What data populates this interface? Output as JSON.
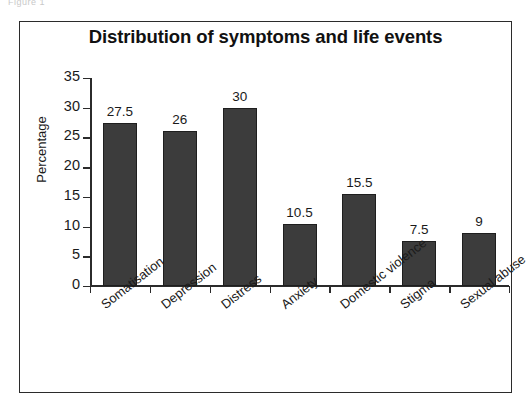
{
  "figure": {
    "caption": "Figure 1"
  },
  "chart_data": {
    "type": "bar",
    "title": "Distribution of symptoms and life events",
    "xlabel": "",
    "ylabel": "Percentage",
    "categories": [
      "Somatisation",
      "Depression",
      "Distress",
      "Anxiety",
      "Domestic violence",
      "Stigma",
      "Sexual abuse"
    ],
    "values": [
      27.5,
      26,
      30,
      10.5,
      15.5,
      7.5,
      9
    ],
    "value_labels": [
      "27.5",
      "26",
      "30",
      "10.5",
      "15.5",
      "7.5",
      "9"
    ],
    "ylim": [
      0,
      35
    ],
    "ytick_labels": [
      "0",
      "5",
      "10",
      "15",
      "20",
      "25",
      "30",
      "35"
    ],
    "ytick_values": [
      0,
      5,
      10,
      15,
      20,
      25,
      30,
      35
    ],
    "grid": false,
    "legend": false,
    "bar_color": "#3c3c3c",
    "axis_color": "#2b2b2b",
    "background": "#ffffff"
  }
}
